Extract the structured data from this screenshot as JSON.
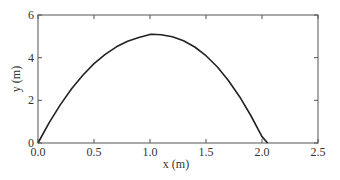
{
  "chart_data": {
    "type": "line",
    "title": "",
    "xlabel": "x (m)",
    "ylabel": "y (m)",
    "xlim": [
      0,
      2.5
    ],
    "ylim": [
      0,
      6
    ],
    "xticks": [
      "0.0",
      "0.5",
      "1.0",
      "1.5",
      "2.0",
      "2.5"
    ],
    "yticks": [
      "0",
      "2",
      "4",
      "6"
    ],
    "grid": false,
    "legend": null,
    "series": [
      {
        "name": "trajectory",
        "color": "#222222",
        "x": [
          0.0,
          0.1,
          0.2,
          0.3,
          0.4,
          0.5,
          0.6,
          0.7,
          0.8,
          0.9,
          1.0,
          1.02,
          1.1,
          1.2,
          1.3,
          1.4,
          1.5,
          1.6,
          1.7,
          1.8,
          1.9,
          2.0,
          2.05
        ],
        "y": [
          0.0,
          0.95,
          1.8,
          2.54,
          3.18,
          3.72,
          4.16,
          4.51,
          4.77,
          4.94,
          5.09,
          5.1,
          5.07,
          4.98,
          4.79,
          4.5,
          4.09,
          3.57,
          2.93,
          2.17,
          1.29,
          0.3,
          0.0
        ]
      }
    ]
  }
}
